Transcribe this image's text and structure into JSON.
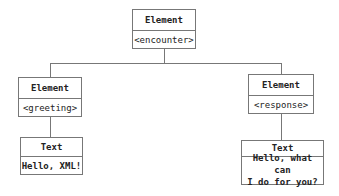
{
  "diagram": {
    "root": {
      "type_label": "Element",
      "value": "<encounter>"
    },
    "left_element": {
      "type_label": "Element",
      "value": "<greeting>"
    },
    "right_element": {
      "type_label": "Element",
      "value": "<response>"
    },
    "left_text": {
      "type_label": "Text",
      "value": "Hello, XML!"
    },
    "right_text": {
      "type_label": "Text",
      "value": "Hello, what can\nI do for you?"
    }
  }
}
